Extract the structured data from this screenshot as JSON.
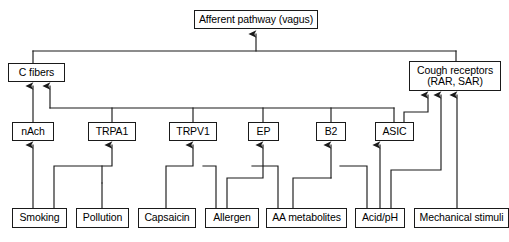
{
  "figure": {
    "line_color": "#1a1a1a",
    "box_fill": "#ffffff",
    "background": "#ffffff"
  },
  "nodes": {
    "afferent": {
      "label": "Afferent pathway (vagus)",
      "x": 194,
      "y": 10,
      "w": 124,
      "h": 19,
      "font": 10.5
    },
    "c_fibers": {
      "label": "C fibers",
      "x": 8,
      "y": 63,
      "w": 57,
      "h": 19,
      "font": 10.5
    },
    "cough_receptors": {
      "label": "Cough receptors\n(RAR, SAR)",
      "x": 409,
      "y": 61,
      "w": 92,
      "h": 30,
      "font": 10.5
    },
    "nach": {
      "label": "nAch",
      "x": 12,
      "y": 122,
      "w": 42,
      "h": 19,
      "font": 10.5
    },
    "trpa1": {
      "label": "TRPA1",
      "x": 88,
      "y": 122,
      "w": 48,
      "h": 19,
      "font": 10.5
    },
    "trpv1": {
      "label": "TRPV1",
      "x": 169,
      "y": 122,
      "w": 48,
      "h": 19,
      "font": 10.5
    },
    "ep": {
      "label": "EP",
      "x": 248,
      "y": 122,
      "w": 31,
      "h": 19,
      "font": 10.5
    },
    "b2": {
      "label": "B2",
      "x": 316,
      "y": 122,
      "w": 30,
      "h": 19,
      "font": 10.5
    },
    "asic": {
      "label": "ASIC",
      "x": 375,
      "y": 122,
      "w": 39,
      "h": 19,
      "font": 10.5
    },
    "smoking": {
      "label": "Smoking",
      "x": 12,
      "y": 208,
      "w": 55,
      "h": 20,
      "font": 10.5
    },
    "pollution": {
      "label": "Pollution",
      "x": 76,
      "y": 208,
      "w": 53,
      "h": 20,
      "font": 10.5
    },
    "capsaicin": {
      "label": "Capsaicin",
      "x": 138,
      "y": 208,
      "w": 58,
      "h": 20,
      "font": 10.5
    },
    "allergen": {
      "label": "Allergen",
      "x": 205,
      "y": 208,
      "w": 54,
      "h": 20,
      "font": 10.5
    },
    "aa_metabolites": {
      "label": "AA metabolites",
      "x": 266,
      "y": 208,
      "w": 81,
      "h": 20,
      "font": 10.5
    },
    "acid_ph": {
      "label": "Acid/pH",
      "x": 355,
      "y": 208,
      "w": 50,
      "h": 20,
      "font": 10.5
    },
    "mechanical": {
      "label": "Mechanical stimuli",
      "x": 414,
      "y": 208,
      "w": 95,
      "h": 20,
      "font": 10.5
    }
  },
  "edges": [
    {
      "name": "bus-afferent-to-receptors",
      "from": "afferent",
      "to": "c_fibers,cough_receptors",
      "arrow": "afferent"
    },
    {
      "name": "nach-to-c-fibers",
      "from": "nAch",
      "to": "C fibers",
      "arrow": true
    },
    {
      "name": "trpa1-to-c-fibers",
      "from": "TRPA1",
      "to": "C fibers",
      "arrow": true
    },
    {
      "name": "receptor-bus-to-c-fibers",
      "from": "TRPA1,TRPV1,EP,B2,ASIC",
      "to": "C fibers",
      "arrow": true
    },
    {
      "name": "asic-to-cough-receptors",
      "from": "ASIC",
      "to": "Cough receptors",
      "arrow": true
    },
    {
      "name": "smoking-to-nach",
      "from": "Smoking",
      "to": "nAch",
      "arrow": true
    },
    {
      "name": "smoking-to-trpa1",
      "from": "Smoking",
      "to": "TRPA1",
      "arrow": true
    },
    {
      "name": "pollution-to-trpa1",
      "from": "Pollution",
      "to": "TRPA1",
      "arrow": true
    },
    {
      "name": "capsaicin-to-trpv1",
      "from": "Capsaicin",
      "to": "TRPV1",
      "arrow": true
    },
    {
      "name": "allergen-to-trpv1",
      "from": "Allergen",
      "to": "TRPV1",
      "arrow": true
    },
    {
      "name": "allergen-to-ep",
      "from": "Allergen",
      "to": "EP",
      "arrow": true
    },
    {
      "name": "aa-metabolites-to-ep",
      "from": "AA metabolites",
      "to": "EP",
      "arrow": true
    },
    {
      "name": "aa-metabolites-to-b2",
      "from": "AA metabolites",
      "to": "B2",
      "arrow": true
    },
    {
      "name": "acid-to-asic",
      "from": "Acid/pH",
      "to": "ASIC",
      "arrow": true
    },
    {
      "name": "acid-to-b2",
      "from": "Acid/pH",
      "to": "B2",
      "arrow": true
    },
    {
      "name": "acid-to-cough-receptors",
      "from": "Acid/pH",
      "to": "Cough receptors",
      "arrow": true
    },
    {
      "name": "mechanical-to-cough-receptors",
      "from": "Mechanical stimuli",
      "to": "Cough receptors",
      "arrow": true
    }
  ]
}
